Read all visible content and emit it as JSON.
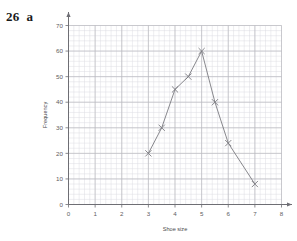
{
  "question": {
    "number": "26",
    "part": "a"
  },
  "chart_data": {
    "type": "line",
    "title": "",
    "subtitle": "",
    "xlabel": "Shoe size",
    "ylabel": "Frequency",
    "xlim": [
      0,
      8
    ],
    "ylim": [
      0,
      70
    ],
    "x_ticks": [
      0,
      1,
      2,
      3,
      4,
      5,
      6,
      7,
      8
    ],
    "y_ticks": [
      0,
      10,
      20,
      30,
      40,
      50,
      60,
      70
    ],
    "x_tick_labels": [
      "0",
      "1",
      "2",
      "3",
      "4",
      "5",
      "6",
      "7",
      "8"
    ],
    "y_tick_labels": [
      "0",
      "10",
      "20",
      "30",
      "40",
      "50",
      "60",
      "70"
    ],
    "grid": true,
    "minor_grid": true,
    "minor_divisions": 5,
    "legend": false,
    "legend_position": "none",
    "marker": "x",
    "series": [
      {
        "name": "Frequency polygon",
        "color": "#7a7a80",
        "x": [
          3,
          3.5,
          4,
          4.5,
          5,
          5.5,
          6,
          7
        ],
        "values": [
          20,
          30,
          45,
          50,
          60,
          40,
          24,
          8
        ],
        "points": [
          {
            "x": 3,
            "y": 20
          },
          {
            "x": 3.5,
            "y": 30
          },
          {
            "x": 4,
            "y": 45
          },
          {
            "x": 4.5,
            "y": 50
          },
          {
            "x": 5,
            "y": 60
          },
          {
            "x": 5.5,
            "y": 40
          },
          {
            "x": 6,
            "y": 24
          },
          {
            "x": 7,
            "y": 8
          }
        ]
      }
    ]
  },
  "colors": {
    "major_grid": "#b9b9bf",
    "minor_grid": "#dcdce2",
    "axis": "#6e6e74",
    "series": "#7a7a80",
    "text": "#5d5d61"
  }
}
